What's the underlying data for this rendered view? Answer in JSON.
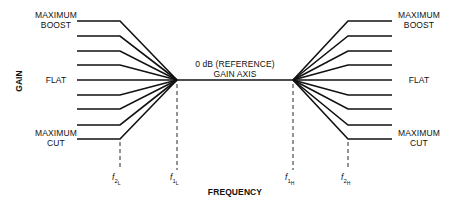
{
  "diagram": {
    "type": "equalizer-shelving-response",
    "y_axis_label": "GAIN",
    "x_axis_label": "FREQUENCY",
    "center_label_line1": "0 dB (REFERENCE)",
    "center_label_line2": "GAIN AXIS",
    "left_labels": {
      "top_line1": "MAXIMUM",
      "top_line2": "BOOST",
      "middle": "FLAT",
      "bottom_line1": "MAXIMUM",
      "bottom_line2": "CUT"
    },
    "right_labels": {
      "top_line1": "MAXIMUM",
      "top_line2": "BOOST",
      "middle": "FLAT",
      "bottom_line1": "MAXIMUM",
      "bottom_line2": "CUT"
    },
    "frequency_markers": [
      {
        "id": "f2L",
        "base": "f",
        "num": "2",
        "sub": "L"
      },
      {
        "id": "f1L",
        "base": "f",
        "num": "1",
        "sub": "L"
      },
      {
        "id": "f1H",
        "base": "f",
        "num": "1",
        "sub": "H"
      },
      {
        "id": "f2H",
        "base": "f",
        "num": "2",
        "sub": "H"
      }
    ],
    "curve_levels": 9,
    "line_color": "#111111"
  }
}
